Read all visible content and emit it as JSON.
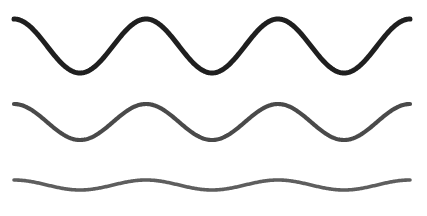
{
  "figure": {
    "background_color": "#ffffff",
    "width": 427,
    "height": 216
  },
  "chart_data": {
    "type": "line",
    "title": "",
    "subtitle": "",
    "xlabel": "",
    "ylabel": "",
    "xlim": [
      14,
      410
    ],
    "ylim": [
      0,
      216
    ],
    "grid": false,
    "legend": null,
    "axes_visible": false,
    "tick_labels_x": [],
    "tick_labels_y": [],
    "annotations": [],
    "series": [
      {
        "name": "wave-top",
        "label": "Top wave (largest amplitude, darkest)",
        "color": "#1f1f1f",
        "stroke_width": 5.0,
        "amplitude": 27,
        "baseline_y": 46,
        "period": 132,
        "phase": "crest-at-start",
        "x_start": 14,
        "x_end": 410,
        "cycles": 3,
        "crest_y": 19,
        "trough_y": 73,
        "crest_x": [
          14,
          146,
          278,
          410
        ],
        "trough_x": [
          80,
          212,
          344
        ]
      },
      {
        "name": "wave-middle",
        "label": "Middle wave (medium amplitude, dark gray)",
        "color": "#4a4a4a",
        "stroke_width": 4.2,
        "amplitude": 18,
        "baseline_y": 122,
        "period": 132,
        "phase": "crest-at-start",
        "x_start": 14,
        "x_end": 410,
        "cycles": 3,
        "crest_y": 104,
        "trough_y": 140,
        "crest_x": [
          14,
          146,
          278,
          410
        ],
        "trough_x": [
          80,
          212,
          344
        ]
      },
      {
        "name": "wave-bottom",
        "label": "Bottom wave (smallest amplitude, medium gray)",
        "color": "#5e5e5e",
        "stroke_width": 3.6,
        "amplitude": 5,
        "baseline_y": 185,
        "period": 132,
        "phase": "crest-at-start",
        "x_start": 14,
        "x_end": 410,
        "cycles": 3,
        "crest_y": 180,
        "trough_y": 190,
        "crest_x": [
          14,
          146,
          278,
          410
        ],
        "trough_x": [
          80,
          212,
          344
        ]
      }
    ]
  }
}
